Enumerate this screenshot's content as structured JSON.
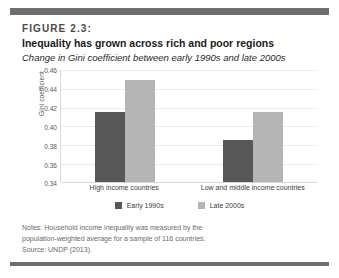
{
  "figure": {
    "number_label": "FIGURE 2.3:",
    "title": "Inequality has grown across rich and poor regions",
    "subtitle": "Change in Gini coefficient between early 1990s and late 2000s"
  },
  "notes": {
    "line1": "Notes: Household income inequality was measured by the",
    "line2": "population-weighted average for a sample of 116 countries.",
    "line3": "Source: UNDP (2013)."
  },
  "colors": {
    "early_1990s": "#575757",
    "late_2000s": "#b5b5b5",
    "band": "#6d6d6d",
    "gridline": "#eceaea",
    "axis": "#d8d8d8"
  },
  "chart_data": {
    "type": "bar",
    "title": "Inequality has grown across rich and poor regions",
    "subtitle": "Change in Gini coefficient between early 1990s and late 2000s",
    "categories": [
      "High income countries",
      "Low and middle income countries"
    ],
    "series": [
      {
        "name": "Early 1990s",
        "values": [
          0.415,
          0.385
        ]
      },
      {
        "name": "Late 2000s",
        "values": [
          0.45,
          0.415
        ]
      }
    ],
    "xlabel": "",
    "ylabel": "Gini coefficient",
    "ylim": [
      0.34,
      0.46
    ],
    "ytick_step": 0.02,
    "yticks": [
      "0.46",
      "0.44",
      "0.42",
      "0.40",
      "0.38",
      "0.36",
      "0.34"
    ],
    "grid": true,
    "legend_position": "bottom"
  }
}
